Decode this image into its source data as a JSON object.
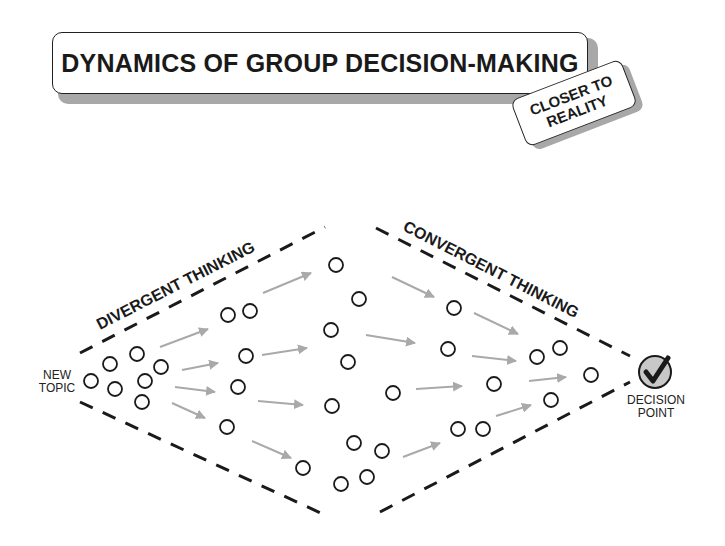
{
  "title": "DYNAMICS OF GROUP DECISION-MAKING",
  "tag": {
    "line1": "CLOSER TO",
    "line2": "REALITY"
  },
  "labels": {
    "start_line1": "NEW",
    "start_line2": "TOPIC",
    "end_line1": "DECISION",
    "end_line2": "POINT",
    "divergent": "DIVERGENT THINKING",
    "convergent": "CONVERGENT THINKING"
  },
  "icons": {
    "decision": "checkmark-icon",
    "idea": "idea-circle-icon",
    "flow": "arrow-icon"
  },
  "colors": {
    "ink": "#1a1a1a",
    "arrow": "#a9a9a9",
    "shadow": "#a8a8a8",
    "decision_fill": "#c8c8c8"
  }
}
